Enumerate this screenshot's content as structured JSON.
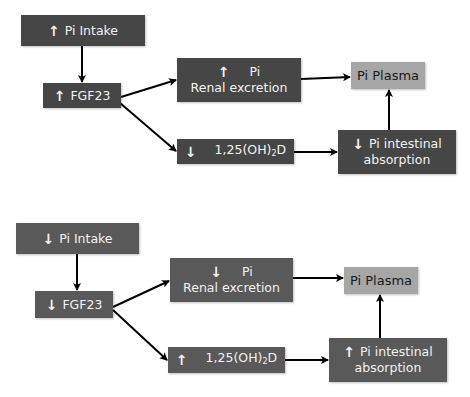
{
  "colors": {
    "top_box": "#464646",
    "bottom_box": "#595959",
    "plasma_box": "#a6a6a6",
    "arrow": "#000000"
  },
  "icons": {
    "up": "🡅",
    "down": "🡇"
  },
  "top": {
    "intake": {
      "arrow": "↑",
      "label": "Pi Intake"
    },
    "fgf23": {
      "arrow": "↑",
      "label": "FGF23"
    },
    "renal": {
      "arrow": "↑",
      "line1": "Pi",
      "line2": "Renal excretion"
    },
    "vitd": {
      "arrow": "↓",
      "label_main": "1,25(OH)",
      "label_sub": "2",
      "label_end": "D"
    },
    "intestinal": {
      "arrow": "↓",
      "line1": "Pi intestinal",
      "line2": "absorption"
    },
    "plasma": {
      "label": "Pi Plasma"
    }
  },
  "bottom": {
    "intake": {
      "arrow": "↓",
      "label": "Pi Intake"
    },
    "fgf23": {
      "arrow": "↓",
      "label": "FGF23"
    },
    "renal": {
      "arrow": "↓",
      "line1": "Pi",
      "line2": "Renal excretion"
    },
    "vitd": {
      "arrow": "↑",
      "label_main": "1,25(OH)",
      "label_sub": "2",
      "label_end": "D"
    },
    "intestinal": {
      "arrow": "↑",
      "line1": "Pi intestinal",
      "line2": "absorption"
    },
    "plasma": {
      "label": "Pi Plasma"
    }
  }
}
